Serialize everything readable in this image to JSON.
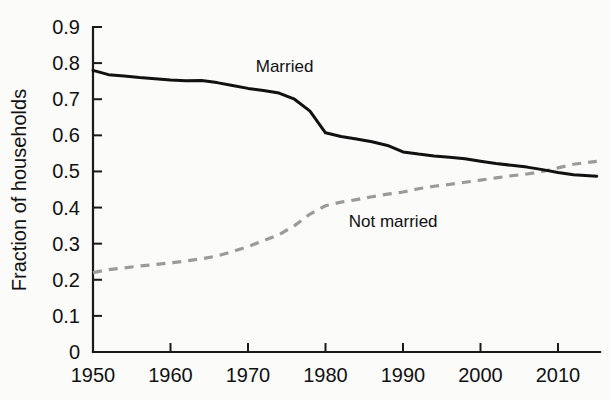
{
  "chart_data": {
    "type": "line",
    "title": "",
    "subtitle": "",
    "xlabel": "",
    "ylabel": "Fraction of households",
    "xlim": [
      1950,
      2015
    ],
    "ylim": [
      0,
      0.9
    ],
    "grid": false,
    "legend_position": "inline-annotation",
    "x_ticks": [
      1950,
      1960,
      1970,
      1980,
      1990,
      2000,
      2010
    ],
    "x_tick_labels": [
      "1950",
      "1960",
      "1970",
      "1980",
      "1990",
      "2000",
      "2010"
    ],
    "y_ticks": [
      0,
      0.1,
      0.2,
      0.3,
      0.4,
      0.5,
      0.6,
      0.7,
      0.8,
      0.9
    ],
    "y_tick_labels": [
      "0",
      "0.1",
      "0.2",
      "0.3",
      "0.4",
      "0.5",
      "0.6",
      "0.7",
      "0.8",
      "0.9"
    ],
    "x": [
      1950,
      1952,
      1954,
      1956,
      1958,
      1960,
      1962,
      1964,
      1966,
      1968,
      1970,
      1972,
      1974,
      1976,
      1978,
      1980,
      1982,
      1984,
      1986,
      1988,
      1990,
      1992,
      1994,
      1996,
      1998,
      2000,
      2002,
      2004,
      2006,
      2008,
      2010,
      2012,
      2015
    ],
    "series": [
      {
        "name": "Married",
        "style": "solid",
        "color": "#111111",
        "label": "Married",
        "label_x": 1971,
        "label_y": 0.775,
        "values": [
          0.78,
          0.768,
          0.764,
          0.76,
          0.757,
          0.753,
          0.751,
          0.752,
          0.746,
          0.738,
          0.73,
          0.724,
          0.717,
          0.7,
          0.667,
          0.607,
          0.597,
          0.59,
          0.582,
          0.572,
          0.554,
          0.548,
          0.543,
          0.539,
          0.535,
          0.528,
          0.522,
          0.517,
          0.512,
          0.505,
          0.497,
          0.491,
          0.487
        ]
      },
      {
        "name": "Not married",
        "style": "dashed",
        "color": "#9a9a9a",
        "label": "Not married",
        "label_x": 1983,
        "label_y": 0.347,
        "values": [
          0.22,
          0.228,
          0.233,
          0.238,
          0.242,
          0.247,
          0.252,
          0.258,
          0.266,
          0.278,
          0.292,
          0.308,
          0.325,
          0.35,
          0.382,
          0.405,
          0.415,
          0.422,
          0.43,
          0.437,
          0.443,
          0.452,
          0.459,
          0.464,
          0.47,
          0.476,
          0.482,
          0.488,
          0.493,
          0.5,
          0.51,
          0.52,
          0.528
        ]
      }
    ],
    "annotations": [
      {
        "text": "Married",
        "x": 1971,
        "y": 0.775
      },
      {
        "text": "Not married",
        "x": 1983,
        "y": 0.347
      }
    ]
  },
  "axes": {
    "y_axis_title": "Fraction of households"
  }
}
